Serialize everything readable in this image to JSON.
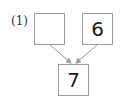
{
  "problem": {
    "label": "(1)"
  },
  "boxes": {
    "left": {
      "value": ""
    },
    "right": {
      "value": "6"
    },
    "bottom": {
      "value": "7"
    }
  },
  "colors": {
    "box_border": "#9a9a9a",
    "arrow": "#9a9a9a",
    "text": "#1a1a1a"
  }
}
